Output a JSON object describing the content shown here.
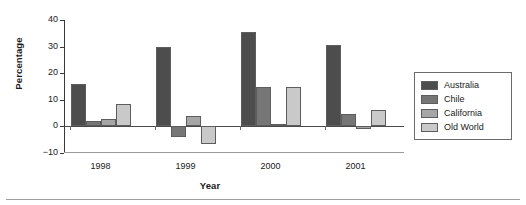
{
  "chart_data": {
    "type": "bar",
    "title": "",
    "xlabel": "Year",
    "ylabel": "Percentage",
    "categories": [
      "1998",
      "1999",
      "2000",
      "2001"
    ],
    "ylim": [
      -10,
      40
    ],
    "yticks": [
      40,
      30,
      20,
      10,
      0,
      -10
    ],
    "grid": false,
    "legend_position": "right",
    "series": [
      {
        "name": "Australia",
        "color": "#4d4d4d",
        "values": [
          16,
          30,
          35.5,
          30.5
        ]
      },
      {
        "name": "Chile",
        "color": "#767676",
        "values": [
          2,
          -4,
          15,
          4.5
        ]
      },
      {
        "name": "California",
        "color": "#a6a6a6",
        "values": [
          2.7,
          4,
          1,
          -1
        ]
      },
      {
        "name": "Old World",
        "color": "#c9c9c9",
        "values": [
          8.5,
          -6.5,
          15,
          6
        ]
      }
    ]
  },
  "legend": {
    "items": [
      {
        "label": "Australia"
      },
      {
        "label": "Chile"
      },
      {
        "label": "California"
      },
      {
        "label": "Old World"
      }
    ]
  }
}
